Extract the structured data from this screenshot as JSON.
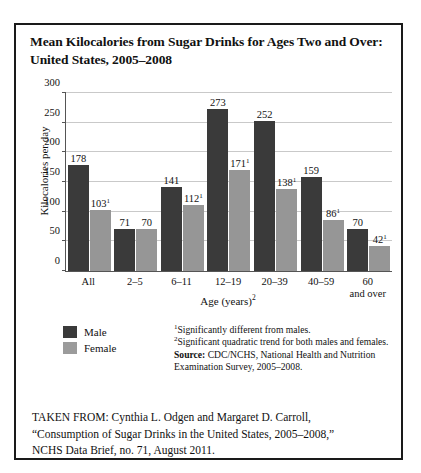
{
  "figure": {
    "title": "Mean Kilocalories from Sugar Drinks for Ages Two and Over: United States, 2005–2008"
  },
  "legend": {
    "male_label": "Male",
    "female_label": "Female",
    "male_color": "#3a3a3a",
    "female_color": "#969696"
  },
  "notes": {
    "footnote_1_marker": "1",
    "footnote_1": "Significantly different from males.",
    "footnote_2_marker": "2",
    "footnote_2": "Significant quadratic trend for both males and females.",
    "source_label": "Source:",
    "source_text": " CDC/NCHS, National Health and Nutrition Examination Survey, 2005–2008."
  },
  "citation": {
    "line1": "TAKEN FROM: Cynthia L. Odgen and Margaret D. Carroll,",
    "line2": "“Consumption of Sugar Drinks in the United States, 2005–2008,”",
    "line3": "NCHS Data Brief, no. 71, August 2011."
  },
  "chart_data": {
    "type": "bar",
    "title": "Mean Kilocalories from Sugar Drinks for Ages Two and Over: United States, 2005–2008",
    "xlabel": "Age (years)",
    "xlabel_superscript": "2",
    "ylabel": "Kilocalories per day",
    "ylim": [
      0,
      300
    ],
    "yticks": [
      0,
      50,
      100,
      150,
      200,
      250,
      300
    ],
    "grid": true,
    "legend_position": "bottom-left",
    "categories": [
      "All",
      "2–5",
      "6–11",
      "12–19",
      "20–39",
      "40–59",
      "60 and over"
    ],
    "category_lines": [
      [
        "All"
      ],
      [
        "2–5"
      ],
      [
        "6–11"
      ],
      [
        "12–19"
      ],
      [
        "20–39"
      ],
      [
        "40–59"
      ],
      [
        "60",
        "and over"
      ]
    ],
    "series": [
      {
        "name": "Male",
        "color": "#3a3a3a",
        "values": [
          178,
          71,
          141,
          273,
          252,
          159,
          70
        ],
        "labels": [
          "178",
          "71",
          "141",
          "273",
          "252",
          "159",
          "70"
        ],
        "label_superscripts": [
          "",
          "",
          "",
          "",
          "",
          "",
          ""
        ]
      },
      {
        "name": "Female",
        "color": "#969696",
        "values": [
          103,
          70,
          112,
          171,
          138,
          86,
          42
        ],
        "labels": [
          "103",
          "70",
          "112",
          "171",
          "138",
          "86",
          "42"
        ],
        "label_superscripts": [
          "1",
          "",
          "1",
          "1",
          "1",
          "1",
          "1"
        ]
      }
    ]
  }
}
